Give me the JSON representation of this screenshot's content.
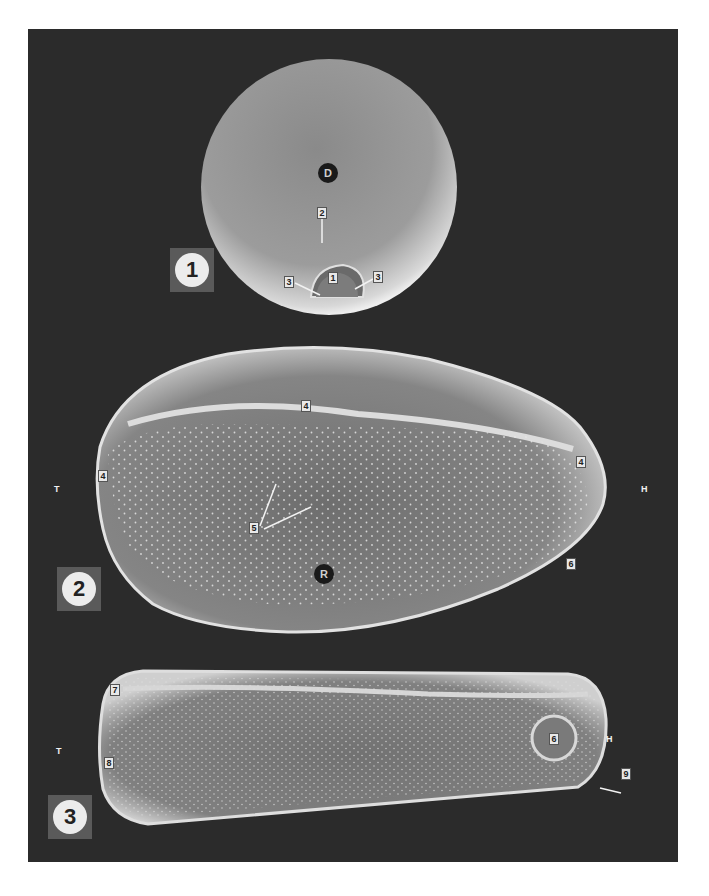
{
  "plate": {
    "background_color": "#2b2b2b",
    "figures": [
      {
        "number": "1",
        "view_label": "D",
        "callouts": [
          "1",
          "2",
          "3",
          "3"
        ]
      },
      {
        "number": "2",
        "view_label": "R",
        "orientation_left": "T",
        "orientation_right": "H",
        "callouts": [
          "4",
          "4",
          "4",
          "5",
          "6"
        ]
      },
      {
        "number": "3",
        "orientation_left": "T",
        "orientation_right": "H",
        "callouts": [
          "7",
          "8",
          "6",
          "9"
        ]
      }
    ]
  }
}
